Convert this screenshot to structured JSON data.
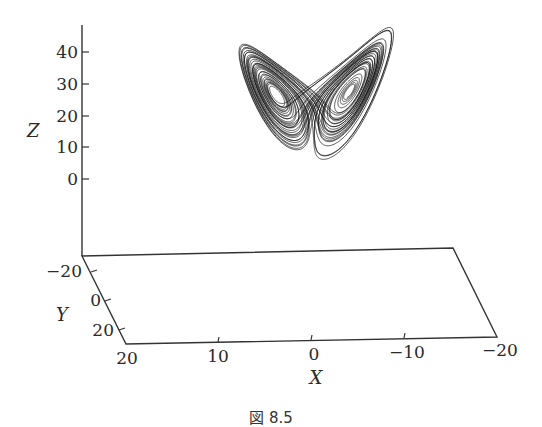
{
  "chart_data": {
    "type": "line",
    "subtype": "3d-trajectory",
    "title": "",
    "caption": "図 8.5",
    "axes": {
      "x": {
        "label": "X",
        "ticks": [
          "20",
          "10",
          "0",
          "−10",
          "−20"
        ],
        "range": [
          20,
          -20
        ]
      },
      "y": {
        "label": "Y",
        "ticks": [
          "−20",
          "0",
          "20"
        ],
        "range": [
          -20,
          20
        ]
      },
      "z": {
        "label": "Z",
        "ticks": [
          "40",
          "30",
          "20",
          "10",
          "0"
        ],
        "range": [
          -10,
          45
        ]
      }
    },
    "grid": false,
    "legend": null,
    "series": [
      {
        "name": "Lorenz trajectory",
        "color": "#111111"
      }
    ],
    "lorenz_params": {
      "sigma": 10,
      "rho": 28,
      "beta": 2.6667
    }
  },
  "figure": {
    "caption": "図 8.5",
    "z_label": "Z",
    "y_label": "Y",
    "x_label": "X",
    "z_ticks": [
      "40",
      "30",
      "20",
      "10",
      "0"
    ],
    "y_ticks": [
      "−20",
      "0",
      "20"
    ],
    "x_ticks": [
      "20",
      "10",
      "0",
      "−10",
      "−20"
    ]
  }
}
